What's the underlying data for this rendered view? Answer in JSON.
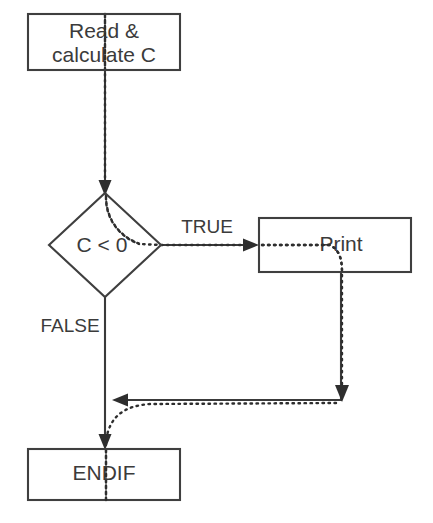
{
  "diagram": {
    "canvas": {
      "width": 433,
      "height": 523,
      "background": "#ffffff"
    },
    "stroke_color": "#3f3f3f",
    "text_color": "#3b3b3b",
    "trace_color": "#2e2e2e",
    "nodes": [
      {
        "id": "read-calculate",
        "shape": "process",
        "label_line1": "Read &",
        "label_line2": "calculate C"
      },
      {
        "id": "condition",
        "shape": "decision",
        "label": "C < 0"
      },
      {
        "id": "print",
        "shape": "process",
        "label": "Print"
      },
      {
        "id": "endif",
        "shape": "process",
        "label": "ENDIF"
      }
    ],
    "edges": [
      {
        "id": "start-to-condition",
        "label": ""
      },
      {
        "id": "condition-true",
        "label": "TRUE"
      },
      {
        "id": "condition-false",
        "label": "FALSE"
      },
      {
        "id": "print-to-merge",
        "label": ""
      },
      {
        "id": "merge-to-endif",
        "label": ""
      }
    ]
  }
}
